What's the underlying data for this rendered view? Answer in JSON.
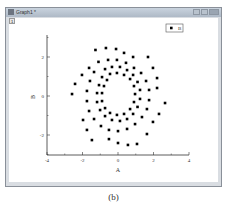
{
  "window": {
    "title": "Graph1 *",
    "layer_tab": "1",
    "buttons": [
      "minimize",
      "maximize",
      "close"
    ]
  },
  "caption": "(b)",
  "legend": {
    "label": "B",
    "marker": "square"
  },
  "axes": {
    "xlabel": "A",
    "ylabel": "B",
    "xticks": [
      "-4",
      "-2",
      "0",
      "2",
      "4"
    ],
    "yticks": [
      "2",
      "0",
      "-2"
    ]
  },
  "chart_data": {
    "type": "scatter",
    "title": "",
    "xlabel": "A",
    "ylabel": "B",
    "xlim": [
      -4,
      4
    ],
    "ylim": [
      -3,
      3
    ],
    "xticks": [
      -4,
      -2,
      0,
      2,
      4
    ],
    "yticks": [
      -2,
      0,
      2
    ],
    "grid": false,
    "legend_position": "top-right",
    "series": [
      {
        "name": "B",
        "marker": "square",
        "color": "#000000",
        "points": [
          [
            -1.27,
            2.36
          ],
          [
            -0.68,
            2.46
          ],
          [
            -0.11,
            2.41
          ],
          [
            0.34,
            2.21
          ],
          [
            0.85,
            2.0
          ],
          [
            1.69,
            2.0
          ],
          [
            1.97,
            1.44
          ],
          [
            2.2,
            0.92
          ],
          [
            2.2,
            0.41
          ],
          [
            2.65,
            -0.36
          ],
          [
            2.31,
            -0.92
          ],
          [
            1.97,
            -1.33
          ],
          [
            1.63,
            -1.95
          ],
          [
            1.07,
            -2.46
          ],
          [
            0.56,
            -2.51
          ],
          [
            0.0,
            -2.41
          ],
          [
            -0.51,
            -2.21
          ],
          [
            -1.47,
            -2.26
          ],
          [
            -1.75,
            -1.74
          ],
          [
            -1.97,
            -1.23
          ],
          [
            -2.59,
            0.1
          ],
          [
            -2.42,
            0.62
          ],
          [
            -2.03,
            1.08
          ],
          [
            -1.63,
            1.44
          ],
          [
            -1.1,
            1.75
          ],
          [
            -0.56,
            1.85
          ],
          [
            -0.06,
            1.85
          ],
          [
            0.45,
            1.7
          ],
          [
            0.9,
            1.44
          ],
          [
            1.3,
            1.18
          ],
          [
            1.58,
            0.77
          ],
          [
            1.75,
            0.31
          ],
          [
            1.75,
            -0.21
          ],
          [
            1.63,
            -0.67
          ],
          [
            1.35,
            -1.08
          ],
          [
            0.96,
            -1.44
          ],
          [
            0.51,
            -1.69
          ],
          [
            0.0,
            -1.8
          ],
          [
            -0.51,
            -1.74
          ],
          [
            -0.96,
            -1.54
          ],
          [
            -1.35,
            -1.18
          ],
          [
            -1.63,
            -0.77
          ],
          [
            -1.75,
            -0.26
          ],
          [
            -1.75,
            0.26
          ],
          [
            -1.58,
            0.77
          ],
          [
            -1.35,
            1.23
          ],
          [
            -0.73,
            1.38
          ],
          [
            -0.34,
            1.49
          ],
          [
            0.11,
            1.49
          ],
          [
            0.51,
            1.33
          ],
          [
            0.85,
            1.08
          ],
          [
            1.1,
            0.72
          ],
          [
            1.24,
            0.31
          ],
          [
            1.24,
            -0.15
          ],
          [
            1.1,
            -0.56
          ],
          [
            0.85,
            -0.92
          ],
          [
            0.51,
            -1.18
          ],
          [
            0.11,
            -1.28
          ],
          [
            -0.34,
            -1.23
          ],
          [
            -0.73,
            -1.03
          ],
          [
            -1.01,
            -0.72
          ],
          [
            -1.18,
            -0.31
          ],
          [
            -1.18,
            0.15
          ],
          [
            -1.07,
            0.56
          ],
          [
            -0.9,
            0.97
          ],
          [
            -0.45,
            1.13
          ],
          [
            -0.06,
            1.18
          ],
          [
            0.34,
            1.08
          ],
          [
            0.68,
            0.87
          ],
          [
            0.9,
            0.51
          ],
          [
            0.96,
            0.1
          ],
          [
            0.9,
            -0.31
          ],
          [
            0.68,
            -0.67
          ],
          [
            0.34,
            -0.92
          ],
          [
            -0.06,
            -0.97
          ],
          [
            -0.45,
            -0.87
          ],
          [
            -0.73,
            -0.62
          ],
          [
            -0.9,
            -0.26
          ],
          [
            -0.9,
            0.15
          ],
          [
            -0.79,
            0.51
          ],
          [
            -0.62,
            0.82
          ]
        ]
      }
    ]
  }
}
